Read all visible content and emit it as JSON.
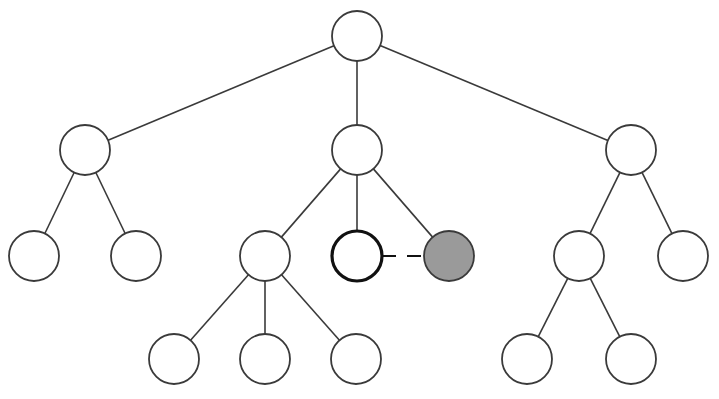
{
  "diagram": {
    "type": "tree",
    "node_radius": 25,
    "colors": {
      "background": "#ffffff",
      "stroke": "#3a3a3a",
      "node_fill": "#ffffff",
      "highlight_fill": "#9a9a9a",
      "selected_stroke": "#111111"
    },
    "nodes": [
      {
        "id": "root",
        "x": 357,
        "y": 36
      },
      {
        "id": "a",
        "x": 85,
        "y": 150
      },
      {
        "id": "b",
        "x": 357,
        "y": 150
      },
      {
        "id": "c",
        "x": 631,
        "y": 150
      },
      {
        "id": "a1",
        "x": 34,
        "y": 256
      },
      {
        "id": "a2",
        "x": 136,
        "y": 256
      },
      {
        "id": "b1",
        "x": 265,
        "y": 256
      },
      {
        "id": "b2",
        "x": 357,
        "y": 256,
        "style": "selected"
      },
      {
        "id": "b3",
        "x": 449,
        "y": 256,
        "style": "filled"
      },
      {
        "id": "c1",
        "x": 579,
        "y": 256
      },
      {
        "id": "c2",
        "x": 683,
        "y": 256
      },
      {
        "id": "b1a",
        "x": 174,
        "y": 359
      },
      {
        "id": "b1b",
        "x": 265,
        "y": 359
      },
      {
        "id": "b1c",
        "x": 356,
        "y": 359
      },
      {
        "id": "c1a",
        "x": 527,
        "y": 359
      },
      {
        "id": "c1b",
        "x": 631,
        "y": 359
      }
    ],
    "edges": [
      {
        "from": "root",
        "to": "a"
      },
      {
        "from": "root",
        "to": "b"
      },
      {
        "from": "root",
        "to": "c"
      },
      {
        "from": "a",
        "to": "a1"
      },
      {
        "from": "a",
        "to": "a2"
      },
      {
        "from": "b",
        "to": "b1"
      },
      {
        "from": "b",
        "to": "b2"
      },
      {
        "from": "b",
        "to": "b3"
      },
      {
        "from": "c",
        "to": "c1"
      },
      {
        "from": "c",
        "to": "c2"
      },
      {
        "from": "b1",
        "to": "b1a"
      },
      {
        "from": "b1",
        "to": "b1b"
      },
      {
        "from": "b1",
        "to": "b1c"
      },
      {
        "from": "c1",
        "to": "c1a"
      },
      {
        "from": "c1",
        "to": "c1b"
      }
    ],
    "links": [
      {
        "from": "b2",
        "to": "b3",
        "style": "dashed"
      }
    ]
  }
}
